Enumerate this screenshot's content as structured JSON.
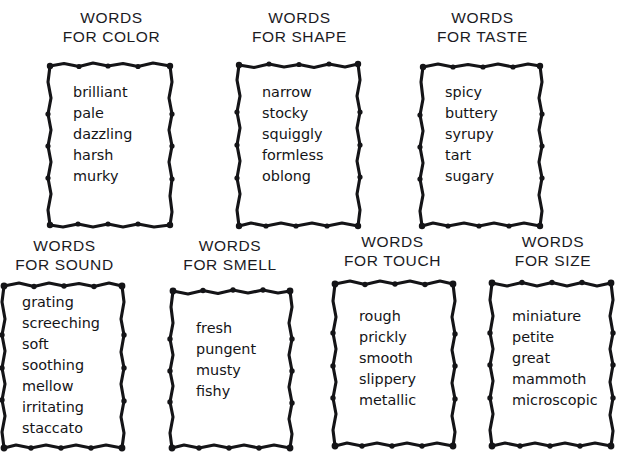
{
  "page": {
    "background_color": "#ffffff",
    "ink_color": "#141417"
  },
  "boxes": [
    {
      "id": "words-for-color",
      "title_line1": "WORDS",
      "title_line2": "FOR COLOR",
      "category": "COLOR",
      "words": [
        "brilliant",
        "pale",
        "dazzling",
        "harsh",
        "murky"
      ]
    },
    {
      "id": "words-for-shape",
      "title_line1": "WORDS",
      "title_line2": "FOR SHAPE",
      "category": "SHAPE",
      "words": [
        "narrow",
        "stocky",
        "squiggly",
        "formless",
        "oblong"
      ]
    },
    {
      "id": "words-for-taste",
      "title_line1": "WORDS",
      "title_line2": "FOR TASTE",
      "category": "TASTE",
      "words": [
        "spicy",
        "buttery",
        "syrupy",
        "tart",
        "sugary"
      ]
    },
    {
      "id": "words-for-sound",
      "title_line1": "WORDS",
      "title_line2": "FOR SOUND",
      "category": "SOUND",
      "words": [
        "grating",
        "screeching",
        "soft",
        "soothing",
        "mellow",
        "irritating",
        "staccato"
      ]
    },
    {
      "id": "words-for-smell",
      "title_line1": "WORDS",
      "title_line2": "FOR SMELL",
      "category": "SMELL",
      "words": [
        "fresh",
        "pungent",
        "musty",
        "fishy"
      ]
    },
    {
      "id": "words-for-touch",
      "title_line1": "WORDS",
      "title_line2": "FOR TOUCH",
      "category": "TOUCH",
      "words": [
        "rough",
        "prickly",
        "smooth",
        "slippery",
        "metallic"
      ]
    },
    {
      "id": "words-for-size",
      "title_line1": "WORDS",
      "title_line2": "FOR SIZE",
      "category": "SIZE",
      "words": [
        "miniature",
        "petite",
        "great",
        "mammoth",
        "microscopic"
      ]
    }
  ]
}
